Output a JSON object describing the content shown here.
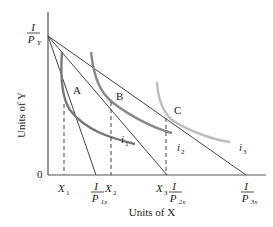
{
  "diagram": {
    "type": "indifference-curve-budget-line",
    "axes": {
      "x_label": "Units of X",
      "y_label": "Units of Y",
      "origin": "0"
    },
    "y_intercept": {
      "num": "I",
      "den": "P",
      "den_sub": "Y"
    },
    "x_intercepts": [
      {
        "num": "I",
        "den": "P",
        "den_sub": "1x"
      },
      {
        "num": "I",
        "den": "P",
        "den_sub": "2x"
      },
      {
        "num": "I",
        "den": "P",
        "den_sub": "3x"
      }
    ],
    "quantities": [
      {
        "name": "X",
        "sub": "1"
      },
      {
        "name": "X",
        "sub": "2"
      },
      {
        "name": "X",
        "sub": "3"
      }
    ],
    "points": [
      {
        "label": "A"
      },
      {
        "label": "B"
      },
      {
        "label": "C"
      }
    ],
    "indifference_curves": [
      {
        "name": "i",
        "sub": "1"
      },
      {
        "name": "i",
        "sub": "2"
      },
      {
        "name": "i",
        "sub": "3"
      }
    ],
    "colors": {
      "axis": "#555555",
      "budget_line": "#444444",
      "i1": "#777777",
      "i2": "#888888",
      "i3": "#bdbdbd",
      "dashed": "#444444"
    }
  }
}
